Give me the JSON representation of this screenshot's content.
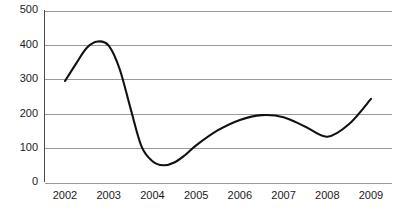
{
  "chart_data": {
    "type": "line",
    "title": "",
    "subtitle": "",
    "xlabel": "",
    "ylabel": "",
    "xlim": [
      2002,
      2009
    ],
    "ylim": [
      0,
      500
    ],
    "grid": true,
    "legend": "none",
    "categories": [
      "2002",
      "2003",
      "2004",
      "2005",
      "2006",
      "2007",
      "2008",
      "2009"
    ],
    "x_tick_labels": [
      "2002",
      "2003",
      "2004",
      "2005",
      "2006",
      "2007",
      "2008",
      "2009"
    ],
    "y_tick_labels": [
      "0",
      "100",
      "200",
      "300",
      "400",
      "500"
    ],
    "y_ticks": [
      0,
      100,
      200,
      300,
      400,
      500
    ],
    "series": [
      {
        "name": "value",
        "color": "#111111",
        "x": [
          2002,
          2002.25,
          2002.5,
          2002.75,
          2003,
          2003.25,
          2003.5,
          2003.75,
          2004,
          2004.25,
          2004.5,
          2004.75,
          2005,
          2005.5,
          2006,
          2006.5,
          2007,
          2007.5,
          2008,
          2008.5,
          2009
        ],
        "values": [
          295,
          345,
          392,
          410,
          398,
          330,
          215,
          105,
          62,
          50,
          58,
          80,
          108,
          152,
          182,
          196,
          190,
          162,
          133,
          170,
          243
        ]
      }
    ],
    "annotations": [
      {
        "label": "peak",
        "x": 2002.75,
        "y": 410
      },
      {
        "label": "trough",
        "x": 2004.25,
        "y": 50
      },
      {
        "label": "secondary-peak",
        "x": 2006.5,
        "y": 196
      },
      {
        "label": "secondary-trough",
        "x": 2008.0,
        "y": 133
      },
      {
        "label": "end",
        "x": 2009,
        "y": 243
      }
    ]
  },
  "axes": {
    "y_labels": [
      {
        "text": "500",
        "value": 500
      },
      {
        "text": "400",
        "value": 400
      },
      {
        "text": "300",
        "value": 300
      },
      {
        "text": "200",
        "value": 200
      },
      {
        "text": "100",
        "value": 100
      },
      {
        "text": "0",
        "value": 0
      }
    ],
    "x_labels": [
      {
        "text": "2002",
        "value": 2002
      },
      {
        "text": "2003",
        "value": 2003
      },
      {
        "text": "2004",
        "value": 2004
      },
      {
        "text": "2005",
        "value": 2005
      },
      {
        "text": "2006",
        "value": 2006
      },
      {
        "text": "2007",
        "value": 2007
      },
      {
        "text": "2008",
        "value": 2008
      },
      {
        "text": "2009",
        "value": 2009
      }
    ]
  },
  "colors": {
    "line": "#111111",
    "grid": "#9a9a9a",
    "axis": "#4a4a4a",
    "background": "#ffffff",
    "text": "#1a1a1a"
  }
}
